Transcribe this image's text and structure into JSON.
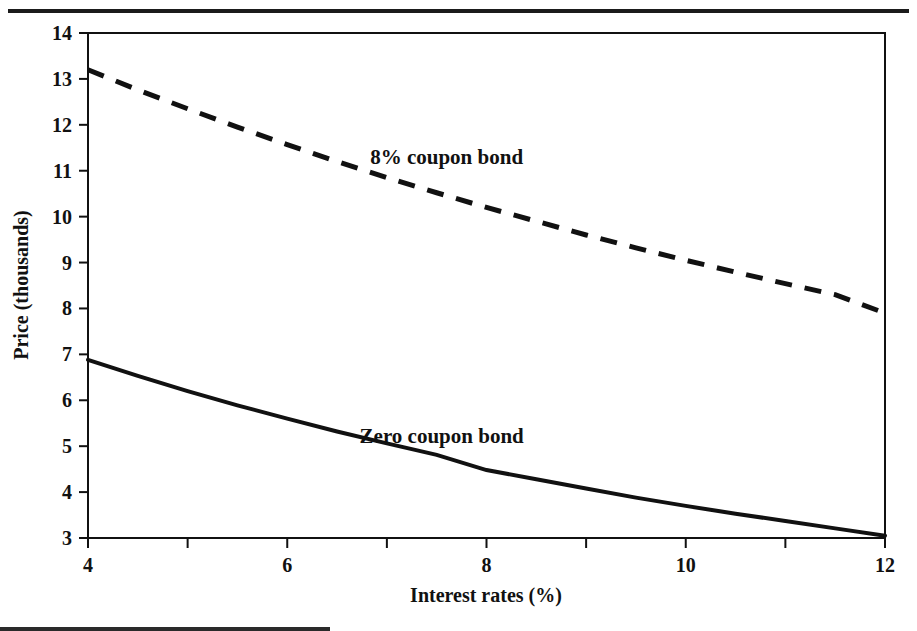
{
  "figure": {
    "name": "bond-price-interest-rate-chart",
    "top_rule_color": "#1b1b1b",
    "background_color": "#ffffff",
    "line_color": "#111111"
  },
  "chart_data": {
    "type": "line",
    "title": "",
    "xlabel": "Interest rates (%)",
    "ylabel": "Price (thousands)",
    "xlim": [
      4,
      12
    ],
    "ylim": [
      3,
      14
    ],
    "grid": false,
    "legend_position": "inline-annotations",
    "x_ticks": [
      4,
      5,
      6,
      7,
      8,
      9,
      10,
      11,
      12
    ],
    "x_tick_labels": [
      "4",
      "",
      "6",
      "",
      "8",
      "",
      "10",
      "",
      "12"
    ],
    "y_ticks": [
      3,
      4,
      5,
      6,
      7,
      8,
      9,
      10,
      11,
      12,
      13,
      14
    ],
    "y_tick_labels": [
      "3",
      "4",
      "5",
      "6",
      "7",
      "8",
      "9",
      "10",
      "11",
      "12",
      "13",
      "14"
    ],
    "x": [
      4,
      4.5,
      5,
      5.5,
      6,
      6.5,
      7,
      7.5,
      8,
      8.5,
      9,
      9.5,
      10,
      10.5,
      11,
      11.5,
      12
    ],
    "series": [
      {
        "name": "8% coupon bond",
        "style": "dashed",
        "annotation": "8% coupon bond",
        "annotation_x": 7.6,
        "annotation_y": 11.15,
        "values": [
          13.2,
          12.76,
          12.35,
          11.95,
          11.57,
          11.2,
          10.85,
          10.52,
          10.2,
          9.9,
          9.6,
          9.32,
          9.05,
          8.79,
          8.54,
          8.3,
          7.9
        ]
      },
      {
        "name": "Zero coupon bond",
        "style": "solid",
        "annotation": "Zero coupon bond",
        "annotation_x": 7.55,
        "annotation_y": 5.07,
        "values": [
          6.88,
          6.53,
          6.2,
          5.89,
          5.6,
          5.32,
          5.06,
          4.81,
          4.48,
          4.28,
          4.08,
          3.88,
          3.7,
          3.53,
          3.37,
          3.21,
          3.05
        ]
      }
    ]
  },
  "annotations": {
    "coupon_bond_label": "8% coupon bond",
    "zero_coupon_label": "Zero coupon bond"
  },
  "axes": {
    "x_title": "Interest rates (%)",
    "y_title": "Price (thousands)"
  }
}
